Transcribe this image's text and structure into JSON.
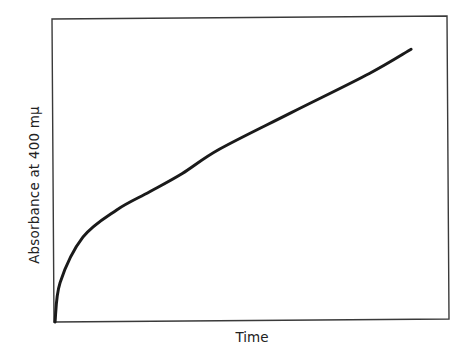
{
  "chart_data": {
    "type": "line",
    "title": "",
    "xlabel": "Time",
    "ylabel": "Absorbance at 400 mμ",
    "grid": false,
    "legend": null,
    "ticks": {
      "x": [],
      "y": []
    },
    "xlim": [
      0,
      1
    ],
    "ylim": [
      0,
      1
    ],
    "series": [
      {
        "name": "absorbance",
        "x": [
          0.0,
          0.013,
          0.071,
          0.157,
          0.241,
          0.324,
          0.418,
          0.6,
          0.8,
          0.906
        ],
        "y": [
          0.0,
          0.13,
          0.28,
          0.37,
          0.43,
          0.49,
          0.57,
          0.69,
          0.82,
          0.9
        ]
      }
    ],
    "annotations": [
      "initial rapid burst followed by linear steady-state increase"
    ]
  },
  "axes": {
    "x_label": "Time",
    "y_label": "Absorbance at 400 mμ"
  },
  "colors": {
    "line": "#1a1a1a",
    "frame": "#3a3a3a",
    "background": "#ffffff"
  }
}
